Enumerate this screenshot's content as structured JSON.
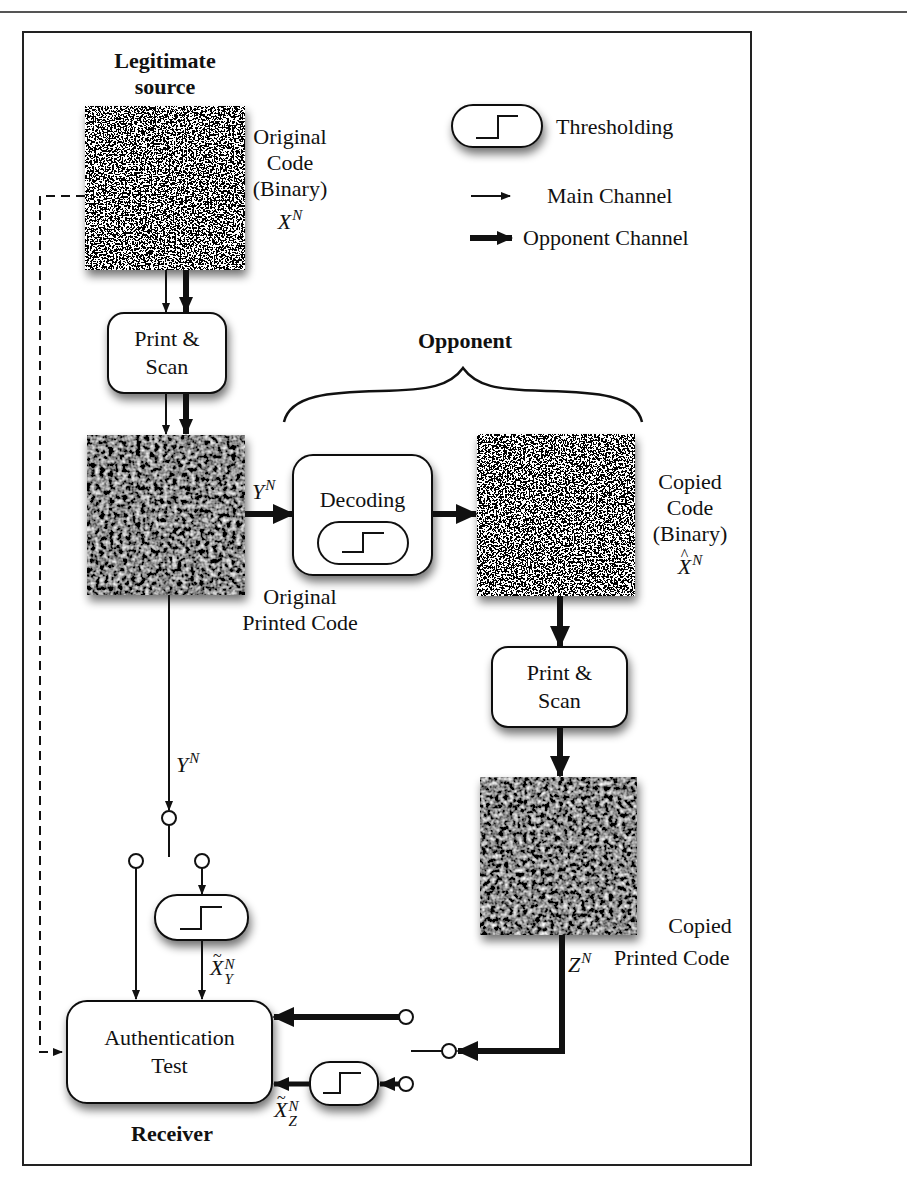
{
  "title_labels": {
    "legitimate_source": "Legitimate source",
    "legitimate_source_line1": "Legitimate",
    "legitimate_source_line2": "source",
    "opponent": "Opponent",
    "receiver": "Receiver"
  },
  "legend": {
    "thresholding": "Thresholding",
    "main_channel": "Main Channel",
    "opponent_channel": "Opponent Channel"
  },
  "nodes": {
    "original_code": {
      "line1": "Original",
      "line2": "Code",
      "line3": "(Binary)",
      "symbol": "X",
      "symbol_sup": "N"
    },
    "print_scan_1": {
      "line1": "Print &",
      "line2": "Scan"
    },
    "original_printed_code": {
      "line1": "Original",
      "line2": "Printed Code"
    },
    "decoding": {
      "label": "Decoding"
    },
    "copied_code": {
      "line1": "Copied",
      "line2": "Code",
      "line3": "(Binary)",
      "symbol": "X",
      "symbol_accent": "^",
      "symbol_sup": "N"
    },
    "print_scan_2": {
      "line1": "Print &",
      "line2": "Scan"
    },
    "copied_printed_code": {
      "line1": "Copied",
      "line2": "Printed Code"
    },
    "authentication_test": {
      "line1": "Authentication",
      "line2": "Test"
    }
  },
  "signals": {
    "y_n_top": {
      "base": "Y",
      "sup": "N"
    },
    "y_n_main": {
      "base": "Y",
      "sup": "N"
    },
    "z_n": {
      "base": "Z",
      "sup": "N"
    },
    "x_tilde_y": {
      "base": "X",
      "accent": "~",
      "sup": "N",
      "sub": "Y"
    },
    "x_tilde_z": {
      "base": "X",
      "accent": "~",
      "sup": "N",
      "sub": "Z"
    }
  },
  "colors": {
    "line": "#111111",
    "frame": "#222222",
    "background": "#ffffff",
    "box_fill": "#ffffff"
  }
}
